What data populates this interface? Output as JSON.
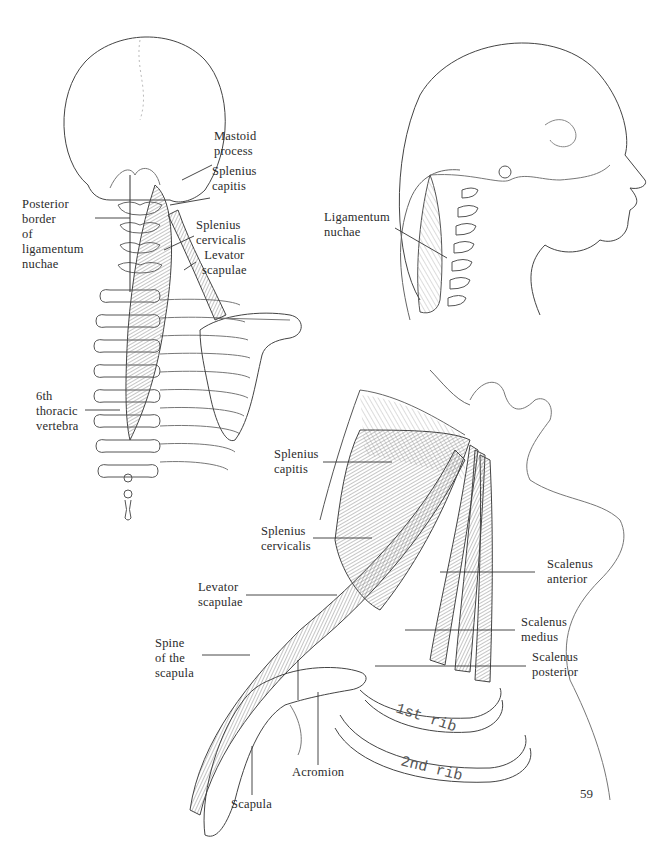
{
  "page_number": "59",
  "figures": {
    "posterior_view": {
      "labels": {
        "mastoid_process": "Mastoid\nprocess",
        "splenius_capitis": "Splenius\ncapitis",
        "posterior_border": "Posterior\nborder\nof\nligamentum\nnuchae",
        "splenius_cervicalis": "Splenius\ncervicalis",
        "levator_scapulae": "Levator\nscapulae",
        "sixth_thoracic": "6th\nthoracic\nvertebra"
      }
    },
    "lateral_head_view": {
      "labels": {
        "ligamentum_nuchae": "Ligamentum\nnuchae"
      }
    },
    "lateral_neck_view": {
      "labels": {
        "splenius_capitis": "Splenius\ncapitis",
        "splenius_cervicalis": "Splenius\ncervicalis",
        "levator_scapulae": "Levator\nscapulae",
        "spine_of_scapula": "Spine\nof the\nscapula",
        "scalenus_anterior": "Scalenus\nanterior",
        "scalenus_medius": "Scalenus\nmedius",
        "scalenus_posterior": "Scalenus\nposterior",
        "acromion": "Acromion",
        "scapula": "Scapula",
        "first_rib": "1st rib",
        "second_rib": "2nd rib"
      }
    }
  },
  "colors": {
    "line": "#3a3a3a",
    "hatch": "#8a8a8a",
    "paper": "#ffffff"
  }
}
